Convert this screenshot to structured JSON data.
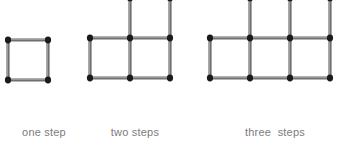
{
  "canvas": {
    "width": 340,
    "height": 146,
    "background": "#ffffff"
  },
  "style": {
    "stick_shaft_color": "#6f6f72",
    "stick_highlight_color": "#a8a8ac",
    "stick_head_color": "#1a1a1a",
    "caption_color": "#7c7c7c",
    "cell_size": 40
  },
  "figures": [
    {
      "id": "one-step",
      "caption": "one step",
      "squares": 1,
      "matchsticks": 4,
      "rows": [
        {
          "row": 0,
          "start_col": 0,
          "count": 1
        }
      ],
      "origin": {
        "x": 8,
        "y": 80
      },
      "caption_box": {
        "x": 0,
        "y": 126,
        "width": 88
      }
    },
    {
      "id": "two-steps",
      "caption": "two steps",
      "squares": 3,
      "matchsticks": 10,
      "rows": [
        {
          "row": 0,
          "start_col": 0,
          "count": 2
        },
        {
          "row": 1,
          "start_col": 1,
          "count": 1
        }
      ],
      "origin": {
        "x": 90,
        "y": 78
      },
      "caption_box": {
        "x": 91,
        "y": 126,
        "width": 88
      }
    },
    {
      "id": "three-steps",
      "caption": "three  steps",
      "squares": 6,
      "matchsticks": 19,
      "rows": [
        {
          "row": 0,
          "start_col": 0,
          "count": 3
        },
        {
          "row": 1,
          "start_col": 1,
          "count": 2
        },
        {
          "row": 2,
          "start_col": 2,
          "count": 1
        }
      ],
      "origin": {
        "x": 210,
        "y": 78
      },
      "caption_box": {
        "x": 220,
        "y": 126,
        "width": 110
      }
    }
  ]
}
